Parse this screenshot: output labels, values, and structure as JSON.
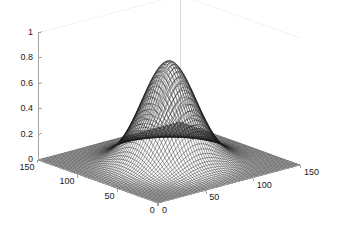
{
  "figure": {
    "background_color": "#ffffff",
    "axis_line_color": "#9a9a9a",
    "mesh_color": "#1a1a1a",
    "tick_text_color": "#1a1a1a",
    "width": 340,
    "height": 234
  },
  "chart_data": {
    "type": "surface",
    "title": "",
    "xlabel": "",
    "ylabel": "",
    "zlabel": "",
    "grid": false,
    "legend": "none",
    "projection": "3d-mesh",
    "xlim": [
      0,
      150
    ],
    "ylim": [
      0,
      150
    ],
    "zlim": [
      0,
      1
    ],
    "x_ticks": [
      0,
      50,
      100,
      150
    ],
    "x_tick_labels": [
      "0",
      "50",
      "100",
      "150"
    ],
    "y_ticks": [
      0,
      50,
      100,
      150
    ],
    "y_tick_labels": [
      "0",
      "50",
      "100",
      "150"
    ],
    "z_ticks": [
      0,
      0.2,
      0.4,
      0.6,
      0.8,
      1
    ],
    "z_tick_labels": [
      "0",
      "0.2",
      "0.4",
      "0.6",
      "0.8",
      "1"
    ],
    "surface_description": "gaussian-peak",
    "peak_value": 0.8,
    "peak_x": 75,
    "peak_y": 75,
    "sigma": 22,
    "baseline_value": 0,
    "mesh_rows": 64,
    "mesh_cols": 64
  },
  "z_axis": {
    "labels": [
      {
        "text": "1",
        "value": 1.0
      },
      {
        "text": "0.8",
        "value": 0.8
      },
      {
        "text": "0.6",
        "value": 0.6
      },
      {
        "text": "0.4",
        "value": 0.4
      },
      {
        "text": "0.2",
        "value": 0.2
      },
      {
        "text": "0",
        "value": 0.0
      }
    ]
  },
  "y_axis": {
    "labels": [
      {
        "text": "150",
        "value": 150
      },
      {
        "text": "100",
        "value": 100
      },
      {
        "text": "50",
        "value": 50
      },
      {
        "text": "0",
        "value": 0
      }
    ]
  },
  "x_axis": {
    "labels": [
      {
        "text": "0",
        "value": 0
      },
      {
        "text": "50",
        "value": 50
      },
      {
        "text": "100",
        "value": 100
      },
      {
        "text": "150",
        "value": 150
      }
    ]
  }
}
